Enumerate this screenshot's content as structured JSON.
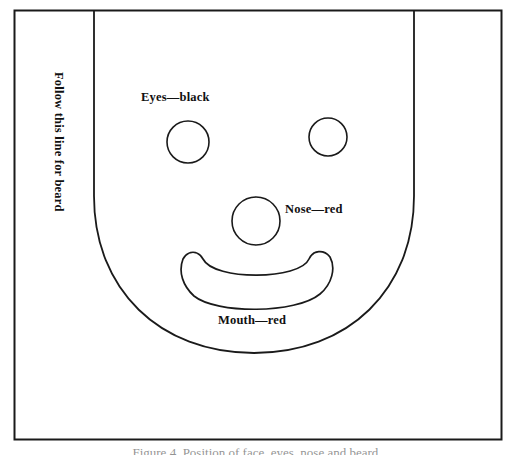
{
  "figure": {
    "type": "craft-pattern-diagram",
    "caption": "Figure 4. Position of face, eyes, nose and beard."
  },
  "labels": {
    "eyes": "Eyes—black",
    "nose": "Nose—red",
    "mouth": "Mouth—red",
    "beard_guide": "Follow this line for beard"
  },
  "colors": {
    "ink": "#111111",
    "paper": "#ffffff",
    "border": "#1a1a1a"
  },
  "geometry": {
    "outer_border": {
      "x": 14,
      "y": 10,
      "width": 487,
      "height": 429
    },
    "face_left_line_x": 94,
    "face_right_line_x": 414,
    "face_top_y": 11,
    "face_curve_start_y": 196,
    "face_bottom_y": 353,
    "eye_left": {
      "cx": 188,
      "cy": 142,
      "r": 21
    },
    "eye_right": {
      "cx": 328,
      "cy": 137,
      "r": 19
    },
    "nose": {
      "cx": 256,
      "cy": 221,
      "r": 24
    },
    "mouth": {
      "left_tip_x": 182,
      "right_tip_x": 332,
      "top_y": 257,
      "bottom_y": 303
    }
  }
}
